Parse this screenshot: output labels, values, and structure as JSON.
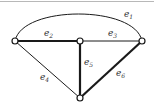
{
  "graph": {
    "nodes": [
      {
        "id": "left",
        "x": 15,
        "y": 41
      },
      {
        "id": "center",
        "x": 80,
        "y": 41
      },
      {
        "id": "right",
        "x": 142,
        "y": 41
      },
      {
        "id": "bottom",
        "x": 80,
        "y": 98
      }
    ],
    "edges": [
      {
        "label": "e",
        "sub": "1",
        "from": "left",
        "to": "right",
        "style": "thin",
        "shape": "arc"
      },
      {
        "label": "e",
        "sub": "2",
        "from": "left",
        "to": "center",
        "style": "thick"
      },
      {
        "label": "e",
        "sub": "3",
        "from": "center",
        "to": "right",
        "style": "thin"
      },
      {
        "label": "e",
        "sub": "4",
        "from": "left",
        "to": "bottom",
        "style": "thin"
      },
      {
        "label": "e",
        "sub": "5",
        "from": "center",
        "to": "bottom",
        "style": "thick"
      },
      {
        "label": "e",
        "sub": "6",
        "from": "right",
        "to": "bottom",
        "style": "thick"
      }
    ],
    "colors": {
      "edge": "#1a1a1a",
      "node_fill": "#ffffff",
      "node_stroke": "#1a1a1a"
    }
  }
}
